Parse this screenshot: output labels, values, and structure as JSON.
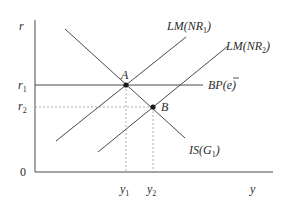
{
  "diagram": {
    "type": "IS-LM-BP",
    "axes": {
      "y_label": "r",
      "x_label": "y",
      "origin_label": "0"
    },
    "y_ticks": [
      {
        "base": "r",
        "sub": "1"
      },
      {
        "base": "r",
        "sub": "2"
      }
    ],
    "x_ticks": [
      {
        "base": "y",
        "sub": "1"
      },
      {
        "base": "y",
        "sub": "2"
      }
    ],
    "curves": {
      "lm1": {
        "pre": "LM(NR",
        "sub": "1",
        "post": ")"
      },
      "lm2": {
        "pre": "LM(NR",
        "sub": "2",
        "post": ")"
      },
      "bp": {
        "pre": "BP(",
        "sym": "e",
        "post": ")"
      },
      "is": {
        "pre": "IS(G",
        "sub": "1",
        "post": ")"
      }
    },
    "points": {
      "a": "A",
      "b": "B"
    },
    "colors": {
      "line": "#4a4a4a",
      "dashed": "#9a9a9a",
      "point": "#1a1a1a"
    }
  }
}
